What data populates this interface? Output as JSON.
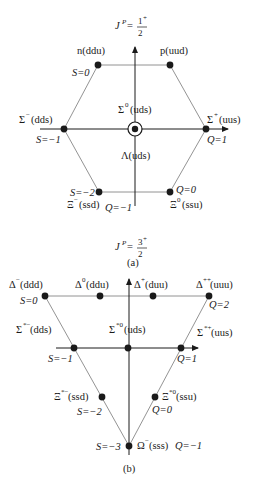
{
  "figure": {
    "panel_a": {
      "caption": "(a)",
      "title_prefix": "J",
      "title_sup": "P",
      "title_eq": "=",
      "title_num": "1",
      "title_num_sup": "+",
      "title_den": "2",
      "particles": [
        {
          "id": "n",
          "label": "n(ddu)"
        },
        {
          "id": "p",
          "label": "p(uud)"
        },
        {
          "id": "sigma_minus",
          "label_sym": "Σ",
          "label_sup": "−",
          "label_q": "(dds)"
        },
        {
          "id": "sigma_zero",
          "label_sym": "Σ",
          "label_sup": "0",
          "label_q": "(uds)"
        },
        {
          "id": "sigma_plus",
          "label_sym": "Σ",
          "label_sup": "+",
          "label_q": "(uus)"
        },
        {
          "id": "lambda",
          "label": "Λ(uds)"
        },
        {
          "id": "xi_minus",
          "label_sym": "Ξ",
          "label_sup": "−",
          "label_q": "(ssd)"
        },
        {
          "id": "xi_zero",
          "label_sym": "Ξ",
          "label_sup": "0",
          "label_q": "(ssu)"
        }
      ],
      "axis_labels": {
        "s0": "S=0",
        "s1": "S=−1",
        "s2": "S=−2",
        "q1": "Q=1",
        "q0": "Q=0",
        "qm1": "Q=−1"
      }
    },
    "panel_b": {
      "caption": "(b)",
      "title_prefix": "J",
      "title_sup": "P",
      "title_eq": "=",
      "title_num": "3",
      "title_num_sup": "+",
      "title_den": "2",
      "particles": [
        {
          "id": "delta_minus",
          "label_sym": "Δ",
          "label_sup": "−",
          "label_q": "(ddd)"
        },
        {
          "id": "delta_zero",
          "label_sym": "Δ",
          "label_sup": "0",
          "label_q": "(ddu)"
        },
        {
          "id": "delta_plus",
          "label_sym": "Δ",
          "label_sup": "+",
          "label_q": "(duu)"
        },
        {
          "id": "delta_plusplus",
          "label_sym": "Δ",
          "label_sup": "++",
          "label_q": "(uuu)"
        },
        {
          "id": "sigma_star_minus",
          "label_sym": "Σ",
          "label_sup": "*−",
          "label_q": "(dds)"
        },
        {
          "id": "sigma_star_zero",
          "label_sym": "Σ",
          "label_sup": "*0",
          "label_q": "(uds)"
        },
        {
          "id": "sigma_star_plus",
          "label_sym": "Σ",
          "label_sup": "*+",
          "label_q": "(uus)"
        },
        {
          "id": "xi_star_minus",
          "label_sym": "Ξ",
          "label_sup": "*−",
          "label_q": "(ssd)"
        },
        {
          "id": "xi_star_zero",
          "label_sym": "Ξ",
          "label_sup": "*0",
          "label_q": "(ssu)"
        },
        {
          "id": "omega_minus",
          "label_sym": "Ω",
          "label_sup": "−",
          "label_q": " (sss)"
        }
      ],
      "axis_labels": {
        "s0": "S=0",
        "s1": "S=−1",
        "s2": "S=−2",
        "s3": "S=−3",
        "q2": "Q=2",
        "q1": "Q=1",
        "q0": "Q=0",
        "qm1": "Q=−1"
      }
    },
    "colors": {
      "ink": "#1a1a1a",
      "line": "#777777",
      "background": "#ffffff"
    }
  }
}
